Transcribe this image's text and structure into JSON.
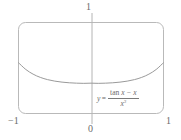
{
  "figure": {
    "kind": "graphing-window",
    "equation": {
      "lhs": "y",
      "equals": "=",
      "numerator_fn": "tan",
      "numerator_rest": " x − x",
      "denominator_base": "x",
      "denominator_exp": "3",
      "plain": "y = (tan x − x) / x³"
    },
    "axis_labels": {
      "y_top": "1",
      "origin": "0",
      "x_left": "−1",
      "x_right": "1"
    },
    "colors": {
      "frame": "#b9b9b9",
      "axis": "#b4b4b4",
      "curve": "#9a9a9a",
      "text": "#6b6b6b",
      "background": "#ffffff"
    }
  },
  "chart_data": {
    "type": "line",
    "title": "",
    "subtitle": "",
    "xlabel": "",
    "ylabel": "",
    "xlim": [
      -1,
      1
    ],
    "ylim": [
      0,
      1
    ],
    "xticks": [
      -1,
      0,
      1
    ],
    "xticklabels": [
      "−1",
      "0",
      "1"
    ],
    "yticks": [
      1
    ],
    "yticklabels": [
      "1"
    ],
    "grid": false,
    "legend": null,
    "annotations": [
      {
        "text": "y = (tan x − x) / x³",
        "x": 0.35,
        "y": 0.25
      }
    ],
    "series": [
      {
        "name": "y = (tan x - x) / x^3",
        "x": [
          -1.0,
          -0.9,
          -0.8,
          -0.7,
          -0.6,
          -0.5,
          -0.4,
          -0.3,
          -0.2,
          -0.1,
          0.0,
          0.1,
          0.2,
          0.3,
          0.4,
          0.5,
          0.6,
          0.7,
          0.8,
          0.9,
          1.0
        ],
        "y": [
          0.5574,
          0.4836,
          0.4324,
          0.3968,
          0.3723,
          0.3557,
          0.3446,
          0.3375,
          0.3333,
          0.3313,
          0.3333,
          0.3313,
          0.3333,
          0.3375,
          0.3446,
          0.3557,
          0.3723,
          0.3968,
          0.4324,
          0.4836,
          0.5574
        ]
      }
    ]
  }
}
